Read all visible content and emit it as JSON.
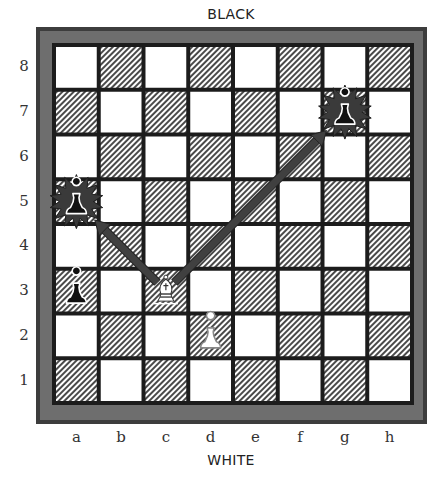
{
  "labels": {
    "top": "BLACK",
    "bottom": "WHITE"
  },
  "files": [
    "a",
    "b",
    "c",
    "d",
    "e",
    "f",
    "g",
    "h"
  ],
  "ranks": [
    "8",
    "7",
    "6",
    "5",
    "4",
    "3",
    "2",
    "1"
  ],
  "colors": {
    "frame_outer": "#3d3d3d",
    "frame_grey": "#6e6e6e",
    "grid": "#1c1c1c",
    "light_square": "#ffffff",
    "dark_square_hatch": "#4a4a4a",
    "arrow": "#404040",
    "burst": "#3a3a3a"
  },
  "pieces": [
    {
      "square": "g7",
      "type": "pawn",
      "color": "black",
      "highlight": "burst",
      "icon": "black-pawn-icon"
    },
    {
      "square": "a5",
      "type": "pawn",
      "color": "black",
      "highlight": "burst",
      "icon": "black-pawn-icon"
    },
    {
      "square": "a3",
      "type": "pawn",
      "color": "black",
      "highlight": "none",
      "icon": "black-pawn-icon"
    },
    {
      "square": "c3",
      "type": "bishop",
      "color": "white",
      "highlight": "none",
      "icon": "white-bishop-icon"
    },
    {
      "square": "d2",
      "type": "pawn",
      "color": "white",
      "highlight": "none",
      "icon": "white-pawn-icon"
    }
  ],
  "arrows": [
    {
      "from": "c3",
      "to": "a5"
    },
    {
      "from": "c3",
      "to": "g7"
    }
  ]
}
